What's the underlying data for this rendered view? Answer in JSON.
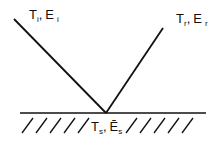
{
  "diagram": {
    "incident": {
      "symbol_T": "T",
      "sub_T": "i",
      "sep": ",",
      "symbol_E": "E",
      "sub_E": "i"
    },
    "reflected": {
      "symbol_T": "T",
      "sub_T": "r",
      "sep": ",",
      "symbol_E": "E",
      "sub_E": "r"
    },
    "surface": {
      "symbol_T": "T",
      "sub_T": "s",
      "sep": ",",
      "symbol_E": "Ē",
      "sub_E": "s"
    },
    "colors": {
      "line": "#111111",
      "background": "#ffffff"
    }
  }
}
